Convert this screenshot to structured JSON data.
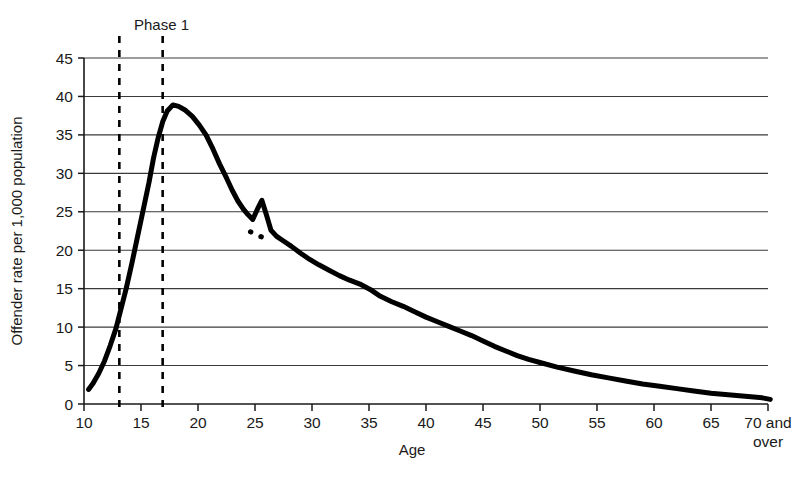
{
  "chart_data": {
    "type": "line",
    "title": "",
    "subtitle": "",
    "xlabel": "Age",
    "ylabel": "Offender rate per 1,000 population",
    "xlim": [
      10,
      70
    ],
    "ylim": [
      0,
      45
    ],
    "grid": true,
    "grid_axis": "y",
    "legend": "none",
    "x_tick_labels": [
      "10",
      "15",
      "20",
      "25",
      "30",
      "35",
      "40",
      "45",
      "50",
      "55",
      "60",
      "65",
      "70 and"
    ],
    "x_tick_label_last_line2": "over",
    "x_tick_values": [
      10,
      15,
      20,
      25,
      30,
      35,
      40,
      45,
      50,
      55,
      60,
      65,
      70
    ],
    "y_tick_labels": [
      "0",
      "5",
      "10",
      "15",
      "20",
      "25",
      "30",
      "35",
      "40",
      "45"
    ],
    "y_tick_values": [
      0,
      5,
      10,
      15,
      20,
      25,
      30,
      35,
      40,
      45
    ],
    "series": [
      {
        "name": "Offender rate",
        "color": "#000000",
        "linewidth": 5,
        "x": [
          10.4,
          10.8,
          11.3,
          11.8,
          12.3,
          12.8,
          13.2,
          13.7,
          14.2,
          14.7,
          15.2,
          15.7,
          16.1,
          16.5,
          16.9,
          17.3,
          17.8,
          18.3,
          18.9,
          19.5,
          20.1,
          20.7,
          21.3,
          21.9,
          22.5,
          23.0,
          23.5,
          24.0,
          24.4,
          24.8,
          25.2,
          25.6,
          26.0,
          26.4,
          26.9,
          27.5,
          28.2,
          29.0,
          29.8,
          30.6,
          31.5,
          32.4,
          33.3,
          34.2,
          35.1,
          36.0,
          37.0,
          38.0,
          39.0,
          40.0,
          41.0,
          42.0,
          43.0,
          44.0,
          45.0,
          46.0,
          47.0,
          48.0,
          49.0,
          50.0,
          51.5,
          53.0,
          54.5,
          56.0,
          57.5,
          59.0,
          60.5,
          62.0,
          63.5,
          65.0,
          66.5,
          68.0,
          69.5,
          70.2
        ],
        "y": [
          1.9,
          2.7,
          4.0,
          5.6,
          7.6,
          9.8,
          12.1,
          15.0,
          18.3,
          21.8,
          25.3,
          28.8,
          32.0,
          34.6,
          36.7,
          38.1,
          38.9,
          38.7,
          38.2,
          37.4,
          36.3,
          35.0,
          33.2,
          31.2,
          29.4,
          27.8,
          26.4,
          25.3,
          24.6,
          24.0,
          25.3,
          26.5,
          24.6,
          22.6,
          21.8,
          21.2,
          20.5,
          19.6,
          18.8,
          18.1,
          17.4,
          16.7,
          16.1,
          15.6,
          14.9,
          14.0,
          13.3,
          12.7,
          12.0,
          11.3,
          10.7,
          10.1,
          9.5,
          8.9,
          8.2,
          7.5,
          6.9,
          6.3,
          5.8,
          5.4,
          4.8,
          4.3,
          3.8,
          3.4,
          3.0,
          2.6,
          2.3,
          2.0,
          1.7,
          1.4,
          1.2,
          1.0,
          0.8,
          0.6
        ]
      }
    ],
    "inset_dotted_segment": {
      "description": "short dotted line bridging the notch below the age-25 spike",
      "x": [
        24.6,
        25.9
      ],
      "y": [
        22.4,
        21.5
      ],
      "style": "dotted"
    },
    "annotations": [
      {
        "name": "phase-1-label",
        "text": "Phase 1",
        "x": 15.2,
        "y": 47.5
      }
    ],
    "vertical_reference_lines": [
      {
        "name": "phase-1-start",
        "x": 13.1,
        "style": "dashed"
      },
      {
        "name": "phase-1-end",
        "x": 16.9,
        "style": "dashed"
      }
    ]
  },
  "axes": {
    "y_title": "Offender rate per 1,000 population",
    "x_title": "Age"
  }
}
